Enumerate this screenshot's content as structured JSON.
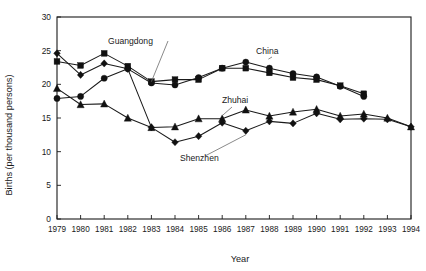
{
  "chart_data": {
    "type": "line",
    "title": "",
    "xlabel": "Year",
    "ylabel": "Births (per thousand persons)",
    "xlim": [
      1979,
      1994
    ],
    "ylim": [
      0,
      30
    ],
    "yticks": [
      0,
      5,
      10,
      15,
      20,
      25,
      30
    ],
    "grid": false,
    "legend_position": "inline-annotations",
    "x": [
      1979,
      1980,
      1981,
      1982,
      1983,
      1984,
      1985,
      1986,
      1987,
      1988,
      1989,
      1990,
      1991,
      1992,
      1993,
      1994
    ],
    "categories": [
      "1979",
      "1980",
      "1981",
      "1982",
      "1983",
      "1984",
      "1985",
      "1986",
      "1987",
      "1988",
      "1989",
      "1990",
      "1991",
      "1992",
      "1993",
      "1994"
    ],
    "series": [
      {
        "name": "Guangdong",
        "marker": "square",
        "values": [
          23.4,
          22.8,
          24.6,
          22.7,
          20.4,
          20.7,
          20.7,
          22.4,
          22.4,
          21.7,
          21.0,
          20.7,
          19.8,
          18.6,
          null,
          null
        ]
      },
      {
        "name": "China",
        "marker": "circle",
        "values": [
          17.9,
          18.2,
          20.9,
          22.3,
          20.2,
          19.9,
          21.0,
          22.4,
          23.3,
          22.4,
          21.6,
          21.1,
          19.7,
          18.2,
          null,
          null
        ]
      },
      {
        "name": "Zhuhai",
        "marker": "triangle",
        "values": [
          19.4,
          17.0,
          17.1,
          15.0,
          13.6,
          13.7,
          14.9,
          14.9,
          16.2,
          15.3,
          15.9,
          16.3,
          15.3,
          15.6,
          15.0,
          13.7
        ]
      },
      {
        "name": "Shenzhen",
        "marker": "diamond",
        "values": [
          24.6,
          21.4,
          23.1,
          22.3,
          13.6,
          11.4,
          12.3,
          14.3,
          13.1,
          14.5,
          14.2,
          15.7,
          14.8,
          14.9,
          14.8,
          13.7
        ]
      }
    ],
    "annotations": [
      {
        "label": "Guangdong",
        "x": 1982
      },
      {
        "label": "China",
        "x": 1988
      },
      {
        "label": "Zhuhai",
        "x": 1987
      },
      {
        "label": "Shenzhen",
        "x": 1986
      }
    ]
  }
}
